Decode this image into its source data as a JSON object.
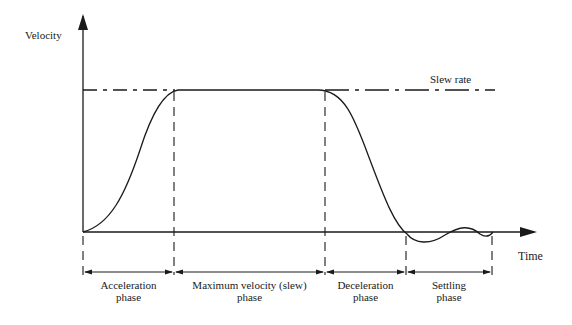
{
  "diagram": {
    "y_axis_label": "Velocity",
    "x_axis_label": "Time",
    "slew_label": "Slew rate",
    "phases": [
      {
        "line1": "Acceleration",
        "line2": "phase"
      },
      {
        "line1": "Maximum velocity (slew)",
        "line2": "phase"
      },
      {
        "line1": "Deceleration",
        "line2": "phase"
      },
      {
        "line1": "Settling",
        "line2": "phase"
      }
    ],
    "colors": {
      "ink": "#1a1a1a",
      "background": "#ffffff"
    }
  }
}
